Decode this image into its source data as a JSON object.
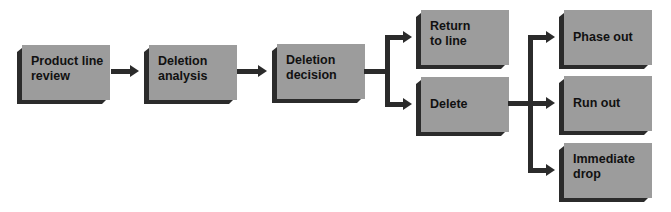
{
  "diagram": {
    "type": "flowchart",
    "nodes": {
      "product_line_review": {
        "label": "Product line\nreview",
        "line1": "Product line",
        "line2": "review"
      },
      "deletion_analysis": {
        "label": "Deletion\nanalysis",
        "line1": "Deletion",
        "line2": "analysis"
      },
      "deletion_decision": {
        "label": "Deletion\ndecision",
        "line1": "Deletion",
        "line2": "decision"
      },
      "return_to_line": {
        "label": "Return\nto line",
        "line1": "Return",
        "line2": "to line"
      },
      "delete": {
        "label": "Delete",
        "line1": "Delete"
      },
      "phase_out": {
        "label": "Phase out",
        "line1": "Phase out"
      },
      "run_out": {
        "label": "Run out",
        "line1": "Run out"
      },
      "immediate_drop": {
        "label": "Immediate\ndrop",
        "line1": "Immediate",
        "line2": "drop"
      }
    },
    "edges": [
      {
        "from": "product_line_review",
        "to": "deletion_analysis"
      },
      {
        "from": "deletion_analysis",
        "to": "deletion_decision"
      },
      {
        "from": "deletion_decision",
        "to": "return_to_line"
      },
      {
        "from": "deletion_decision",
        "to": "delete"
      },
      {
        "from": "delete",
        "to": "phase_out"
      },
      {
        "from": "delete",
        "to": "run_out"
      },
      {
        "from": "delete",
        "to": "immediate_drop"
      }
    ],
    "colors": {
      "box_face": "#9c9c9c",
      "box_shadow": "#2b2b2b",
      "connector": "#2b2b2b",
      "text": "#111111",
      "background": "#ffffff"
    }
  }
}
